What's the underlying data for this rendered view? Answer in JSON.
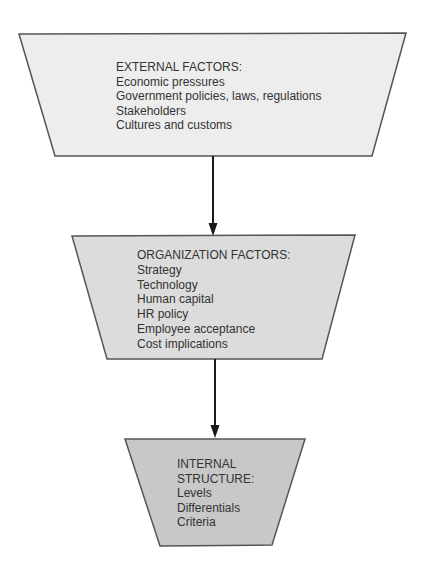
{
  "diagram": {
    "type": "flow",
    "direction": "top-to-bottom",
    "colors": {
      "outline": "#555555",
      "arrow": "#1a1a1a",
      "text": "#333333",
      "external_fill": "#ededed",
      "organization_fill": "#dcdcdc",
      "internal_fill": "#c8c8c8"
    },
    "boxes": [
      {
        "id": "external",
        "shape": "inverted-trapezoid",
        "title": "EXTERNAL FACTORS:",
        "items": [
          "Economic pressures",
          "Government policies, laws, regulations",
          "Stakeholders",
          "Cultures and customs"
        ]
      },
      {
        "id": "organization",
        "shape": "inverted-trapezoid",
        "title": "ORGANIZATION FACTORS:",
        "items": [
          "Strategy",
          "Technology",
          "Human capital",
          "HR policy",
          "Employee acceptance",
          "Cost implications"
        ]
      },
      {
        "id": "internal",
        "shape": "inverted-trapezoid",
        "title_lines": [
          "INTERNAL",
          "STRUCTURE:"
        ],
        "items": [
          "Levels",
          "Differentials",
          "Criteria"
        ]
      }
    ],
    "connectors": [
      {
        "from": "external",
        "to": "organization",
        "type": "arrow"
      },
      {
        "from": "organization",
        "to": "internal",
        "type": "arrow"
      }
    ]
  }
}
